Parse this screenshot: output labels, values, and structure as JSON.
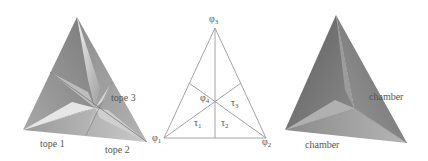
{
  "figure": {
    "left_panel": {
      "labels": [
        "tope 1",
        "tope 2",
        "tope 3"
      ]
    },
    "middle_panel": {
      "vertices": {
        "phi1": "φ",
        "phi1_sub": "1",
        "phi2": "φ",
        "phi2_sub": "2",
        "phi3": "φ",
        "phi3_sub": "3",
        "phi4": "φ",
        "phi4_sub": "4"
      },
      "regions": {
        "tau1": "τ",
        "tau1_sub": "1",
        "tau2": "τ",
        "tau2_sub": "2",
        "tau3": "τ",
        "tau3_sub": "3"
      }
    },
    "right_panel": {
      "labels": [
        "chamber",
        "chamber"
      ]
    }
  },
  "colors": {
    "line": "#999999",
    "text": "#555555",
    "face_dark": "#6e6e6e",
    "face_mid": "#9a9a9a",
    "face_light": "#d8d8d8"
  }
}
